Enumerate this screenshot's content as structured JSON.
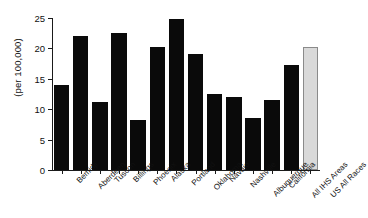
{
  "chart_data": {
    "type": "bar",
    "title": "",
    "subtitle": "",
    "xlabel": "",
    "ylabel": "(per 100,000)",
    "ylim": [
      0,
      25
    ],
    "yticks": [
      0,
      5,
      10,
      15,
      20,
      25
    ],
    "ytick_labels": [
      "0",
      "5",
      "10",
      "15",
      "20",
      "25"
    ],
    "grid": false,
    "legend": "none",
    "categories": [
      "Bemidji",
      "Aberdeen",
      "Tuscon",
      "Billings",
      "Phoenix",
      "Alaska",
      "Portland",
      "Oklahoma",
      "Navajo",
      "Nashville",
      "Albuquerque",
      "California",
      "All IHS Areas",
      "US All Races"
    ],
    "values": [
      14.0,
      22.1,
      11.2,
      22.6,
      8.3,
      20.3,
      24.8,
      19.0,
      12.5,
      12.0,
      8.5,
      11.5,
      17.3,
      20.2
    ],
    "bar_colors": [
      "#0a0a0a",
      "#0a0a0a",
      "#0a0a0a",
      "#0a0a0a",
      "#0a0a0a",
      "#0a0a0a",
      "#0a0a0a",
      "#0a0a0a",
      "#0a0a0a",
      "#0a0a0a",
      "#0a0a0a",
      "#0a0a0a",
      "#0a0a0a",
      "#d9d9d9"
    ],
    "highlight_category": "US All Races",
    "axis_color": "#1a1a1a",
    "background": "#ffffff"
  }
}
